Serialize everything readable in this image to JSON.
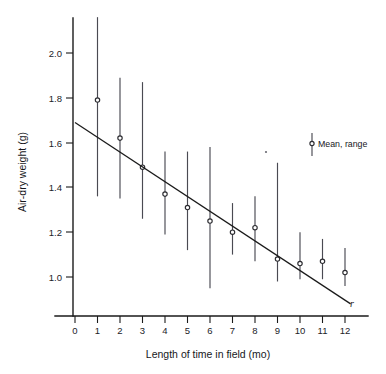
{
  "chart_data": {
    "type": "scatter",
    "title": "",
    "xlabel": "Length of time in field (mo)",
    "ylabel": "Air-dry weight (g)",
    "xlim": [
      -0.6,
      13.2
    ],
    "ylim": [
      0.85,
      2.22
    ],
    "xticks": [
      0,
      1,
      2,
      3,
      4,
      5,
      6,
      7,
      8,
      9,
      10,
      11,
      12
    ],
    "xtick_labels": [
      "0",
      "1",
      "2",
      "3",
      "4",
      "5",
      "6",
      "7",
      "8",
      "9",
      "10",
      "11",
      "12"
    ],
    "yticks": [
      1.0,
      1.2,
      1.4,
      1.6,
      1.8,
      2.0
    ],
    "ytick_labels": [
      "1.0",
      "1.2",
      "1.4",
      "1.6",
      "1.8",
      "2.0"
    ],
    "grid": false,
    "legend_position": "upper right",
    "x": [
      1,
      2,
      3,
      4,
      5,
      6,
      7,
      8,
      9,
      10,
      11,
      12
    ],
    "means": [
      1.79,
      1.62,
      1.49,
      1.37,
      1.31,
      1.25,
      1.2,
      1.22,
      1.08,
      1.06,
      1.07,
      1.02
    ],
    "range_low": [
      1.36,
      1.35,
      1.26,
      1.19,
      1.12,
      0.95,
      1.1,
      1.07,
      0.98,
      0.99,
      0.99,
      0.96
    ],
    "range_high": [
      2.16,
      1.89,
      1.87,
      1.56,
      1.56,
      1.58,
      1.33,
      1.36,
      1.51,
      1.2,
      1.17,
      1.13
    ],
    "series": [
      {
        "name": "Mean, range",
        "values": [
          1.79,
          1.62,
          1.49,
          1.37,
          1.31,
          1.25,
          1.2,
          1.22,
          1.08,
          1.06,
          1.07,
          1.02
        ]
      }
    ],
    "regression_line": {
      "label": "r",
      "x_start": 0.0,
      "y_start": 1.69,
      "x_end": 12.25,
      "y_end": 0.88
    },
    "annotations": [
      {
        "text": "Mean, range",
        "x": 10.9,
        "y": 1.63
      },
      {
        "text": "r",
        "x": 12.4,
        "y": 0.88
      }
    ]
  },
  "legend": {
    "entry_label": "Mean, range"
  },
  "axes": {
    "x_title": "Length of time in field (mo)",
    "y_title": "Air-dry weight (g)"
  }
}
